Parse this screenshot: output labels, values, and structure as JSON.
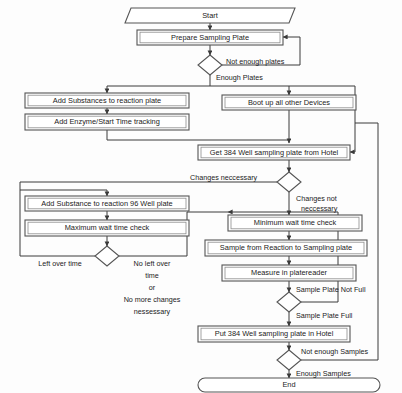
{
  "diagram": {
    "colors": {
      "background": "#fdfdfd",
      "shape_fill": "#ffffff",
      "shape_stroke": "#555555",
      "connector": "#3a3a3a",
      "text": "#1b1b1b"
    },
    "nodes": {
      "start": {
        "label": "Start",
        "shape": "terminator-parallelogram"
      },
      "prepare_sampling_plate": {
        "label": "Prepare Sampling Plate",
        "shape": "process"
      },
      "decision_plates": {
        "label": "",
        "shape": "decision"
      },
      "add_substances_reaction_plate": {
        "label": "Add Substances to reaction plate",
        "shape": "process"
      },
      "add_enzyme_start_time": {
        "label": "Add Enzyme/Start Time tracking",
        "shape": "process"
      },
      "boot_up_devices": {
        "label": "Boot up all other Devices",
        "shape": "process"
      },
      "get_384_plate": {
        "label": "Get 384 Well sampling plate from Hotel",
        "shape": "process"
      },
      "decision_changes": {
        "label": "",
        "shape": "decision"
      },
      "add_substance_96_well": {
        "label": "Add Substance to reaction 96 Well plate",
        "shape": "process"
      },
      "maximum_wait_time_check": {
        "label": "Maximum wait time check",
        "shape": "process"
      },
      "decision_left_over_time": {
        "label": "",
        "shape": "decision"
      },
      "minimum_wait_time_check": {
        "label": "Minimum wait time check",
        "shape": "process"
      },
      "sample_from_reaction": {
        "label": "Sample from Reaction to Sampling plate",
        "shape": "process"
      },
      "measure_platereader": {
        "label": "Measure in platereader",
        "shape": "process"
      },
      "decision_plate_full": {
        "label": "",
        "shape": "decision"
      },
      "put_384_plate_hotel": {
        "label": "Put 384 Well sampling plate in Hotel",
        "shape": "process"
      },
      "decision_samples": {
        "label": "",
        "shape": "decision"
      },
      "end": {
        "label": "End",
        "shape": "terminator-rounded"
      }
    },
    "edge_labels": {
      "not_enough_plates": "Not enough plates",
      "enough_plates": "Enough Plates",
      "changes_necessary": "Changes neccessary",
      "changes_not_necessary_line1": "Changes not",
      "changes_not_necessary_line2": "neccessary",
      "left_over_time": "Left over time",
      "no_left_over_line1": "No left over",
      "no_left_over_line2": "time",
      "no_left_over_line3": "or",
      "no_left_over_line4": "No more changes",
      "no_left_over_line5": "nessessary",
      "sample_plate_not_full": "Sample Plate Not Full",
      "sample_plate_full": "Sample Plate Full",
      "not_enough_samples": "Not enough Samples",
      "enough_samples": "Enough Samples"
    }
  }
}
